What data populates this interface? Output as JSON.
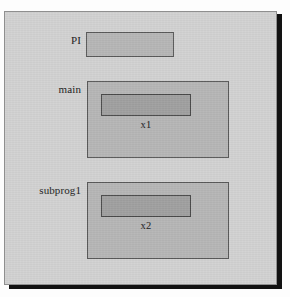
{
  "figure": {
    "type": "memory-scope-diagram"
  },
  "frame": {
    "name": "program-panel",
    "background_color": "#d3d3d3",
    "border_color": "#8f8f8f",
    "shadow_color": "#111111"
  },
  "colors": {
    "scope_fill": "#b7b7b7",
    "scope_border": "#5a5a5a",
    "variable_fill": "#a1a1a1",
    "variable_border": "#4a4a4a",
    "text": "#1c1c1c"
  },
  "scopes": [
    {
      "id": "pi",
      "label": "PI",
      "has_variable": false,
      "variable_label": ""
    },
    {
      "id": "main",
      "label": "main",
      "has_variable": true,
      "variable_label": "x1"
    },
    {
      "id": "subprog1",
      "label": "subprog1",
      "has_variable": true,
      "variable_label": "x2"
    }
  ]
}
